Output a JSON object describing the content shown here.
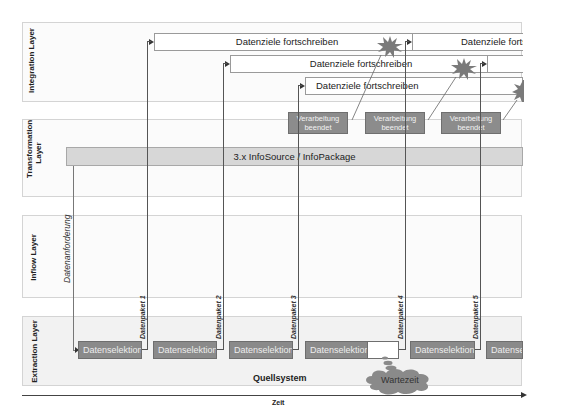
{
  "lanes": [
    {
      "id": "integration",
      "label": "Integration Layer"
    },
    {
      "id": "transformation",
      "label": "Transformation Layer"
    },
    {
      "id": "inflow",
      "label": "Inflow Layer"
    },
    {
      "id": "extraction",
      "label": "Extraction Layer"
    }
  ],
  "integration": {
    "targets": [
      {
        "label": "Datenziele fortschreiben"
      },
      {
        "label": "Datenziele fortschreiben"
      },
      {
        "label": "Datenziele fortschreiben"
      },
      {
        "label": "Datenziele fortschreiben"
      },
      {
        "label": ""
      },
      {
        "label": ""
      }
    ]
  },
  "transformation": {
    "processing": [
      {
        "label": "Verarbeitung beendet"
      },
      {
        "label": "Verarbeitung beendet"
      },
      {
        "label": "Verarbeitung beendet"
      }
    ],
    "info_bar": "3.x InfoSource / InfoPackage"
  },
  "inflow": {
    "request_label": "Datenanforderung"
  },
  "extraction": {
    "selections": [
      {
        "label": "Datenselektion"
      },
      {
        "label": "Datenselektion"
      },
      {
        "label": "Datenselektion"
      },
      {
        "label": "Datenselektion"
      },
      {
        "label": "Datenselektion"
      },
      {
        "label": "Datenselektion"
      }
    ],
    "packets": [
      {
        "label": "Datenpaket 1"
      },
      {
        "label": "Datenpaket 2"
      },
      {
        "label": "Datenpaket 3"
      },
      {
        "label": "Datenpaket 4"
      },
      {
        "label": "Datenpaket 5"
      }
    ],
    "source_label": "Quellsystem",
    "wait_label": "Wartezeit"
  },
  "axis": {
    "label": "Zeit"
  },
  "colors": {
    "dark_box": "#8a8a8a",
    "info_bar": "#d7d7d7",
    "lane_border": "#d4d4d4",
    "star": "#7a7a7a"
  }
}
